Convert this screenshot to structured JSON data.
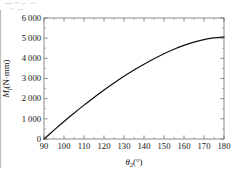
{
  "figure": {
    "background_color": "#ffffff",
    "frame_color": "#6f6f6f",
    "curve_color": "#111111"
  },
  "axes": {
    "x_title_main": "θ",
    "x_title_sub": "2",
    "x_title_unit": "(°)",
    "y_title_main": "M",
    "y_title_sub": "f",
    "y_title_unit": "(N·mm)",
    "x_tick_labels": [
      "90",
      "100",
      "110",
      "120",
      "130",
      "140",
      "150",
      "160",
      "170",
      "180"
    ],
    "y_tick_labels": [
      "0",
      "1 000",
      "2 000",
      "3 000",
      "4 000",
      "5 000",
      "6 000"
    ]
  },
  "chart_data": {
    "type": "line",
    "title": "",
    "subtitle": "",
    "xlabel": "θ₂(°)",
    "ylabel": "M_f(N·mm)",
    "xlim": [
      90,
      180
    ],
    "ylim": [
      0,
      6000
    ],
    "xticks": [
      90,
      100,
      110,
      120,
      130,
      140,
      150,
      160,
      170,
      180
    ],
    "yticks": [
      0,
      1000,
      2000,
      3000,
      4000,
      5000,
      6000
    ],
    "grid": false,
    "legend": null,
    "minor_ticks": true,
    "tick_direction": "in",
    "series": [
      {
        "name": "Mf",
        "x": [
          90,
          95,
          100,
          105,
          110,
          115,
          120,
          125,
          130,
          135,
          140,
          145,
          150,
          155,
          160,
          165,
          170,
          175,
          180
        ],
        "y": [
          0,
          440,
          870,
          1280,
          1680,
          2060,
          2430,
          2780,
          3110,
          3420,
          3710,
          3980,
          4230,
          4450,
          4640,
          4800,
          4930,
          5010,
          5060
        ]
      }
    ]
  }
}
